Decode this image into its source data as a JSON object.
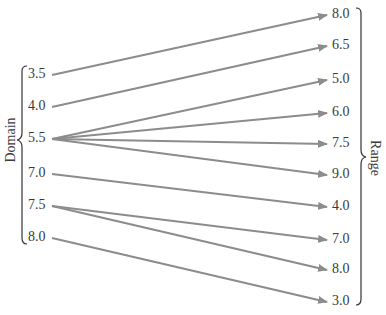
{
  "diagram": {
    "type": "mapping-diagram",
    "domain_label": "Domain",
    "range_label": "Range",
    "arrow_color": "#8c8c8c",
    "text_color": "#3a3a3a",
    "domain": [
      {
        "value": "3.5",
        "y": 75
      },
      {
        "value": "4.0",
        "y": 107
      },
      {
        "value": "5.5",
        "y": 139
      },
      {
        "value": "7.0",
        "y": 174
      },
      {
        "value": "7.5",
        "y": 206
      },
      {
        "value": "8.0",
        "y": 238
      }
    ],
    "range": [
      {
        "value": "8.0",
        "y": 15
      },
      {
        "value": "6.5",
        "y": 46
      },
      {
        "value": "5.0",
        "y": 80
      },
      {
        "value": "6.0",
        "y": 113
      },
      {
        "value": "7.5",
        "y": 144
      },
      {
        "value": "9.0",
        "y": 175
      },
      {
        "value": "4.0",
        "y": 207
      },
      {
        "value": "7.0",
        "y": 240
      },
      {
        "value": "8.0",
        "y": 270
      },
      {
        "value": "3.0",
        "y": 302
      }
    ],
    "mappings": [
      {
        "from": 0,
        "to": 0
      },
      {
        "from": 1,
        "to": 1
      },
      {
        "from": 2,
        "to": 2
      },
      {
        "from": 2,
        "to": 3
      },
      {
        "from": 2,
        "to": 4
      },
      {
        "from": 2,
        "to": 5
      },
      {
        "from": 3,
        "to": 6
      },
      {
        "from": 4,
        "to": 7
      },
      {
        "from": 4,
        "to": 8
      },
      {
        "from": 5,
        "to": 9
      }
    ]
  }
}
